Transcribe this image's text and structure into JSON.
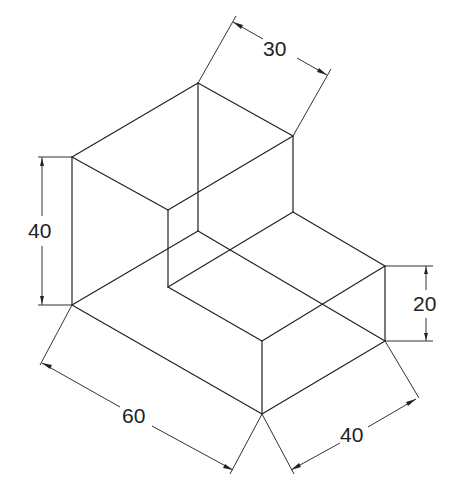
{
  "drawing": {
    "type": "isometric-view",
    "description": "L-shaped block isometric drawing with dimensions",
    "colors": {
      "line": "#222222",
      "background": "#ffffff"
    }
  },
  "dimensions": {
    "top_depth": "30",
    "left_height": "40",
    "right_height": "20",
    "bottom_length": "60",
    "bottom_width": "40"
  },
  "geometry": {
    "edges": [
      [
        72,
        157,
        198,
        83
      ],
      [
        198,
        83,
        293,
        136
      ],
      [
        72,
        157,
        168,
        210
      ],
      [
        168,
        210,
        293,
        136
      ],
      [
        72,
        157,
        72,
        305
      ],
      [
        198,
        83,
        198,
        231
      ],
      [
        293,
        136,
        293,
        212
      ],
      [
        168,
        210,
        168,
        287
      ],
      [
        293,
        212,
        385,
        266
      ],
      [
        168,
        287,
        293,
        212
      ],
      [
        168,
        287,
        262,
        341
      ],
      [
        262,
        341,
        385,
        266
      ],
      [
        385,
        266,
        385,
        341
      ],
      [
        262,
        341,
        262,
        414
      ],
      [
        72,
        305,
        262,
        414
      ],
      [
        262,
        414,
        385,
        341
      ],
      [
        72,
        305,
        198,
        231
      ],
      [
        198,
        231,
        385,
        341
      ]
    ]
  }
}
